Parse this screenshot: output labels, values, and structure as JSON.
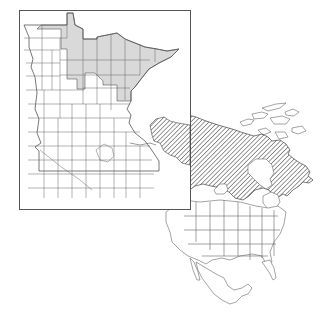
{
  "figure": {
    "type": "species range map",
    "inset": {
      "region": "Minnesota",
      "description": "County map of Minnesota with northern/northeastern counties shaded gray",
      "shaded_color": "#d9d9d9",
      "frame_color": "#555555"
    },
    "main_map": {
      "region": "North America",
      "description": "Outline map of North America with boreal Canada and Alaska hatched with diagonal lines",
      "hatch_color": "#444444"
    },
    "colors": {
      "background": "#ffffff",
      "outline": "#555555",
      "shade": "#d9d9d9"
    }
  }
}
